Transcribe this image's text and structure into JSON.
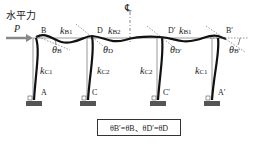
{
  "diagram": {
    "force_label": "水平力",
    "force_symbol": "P",
    "centerline_symbol": "℄",
    "nodes": {
      "top": [
        "B",
        "D",
        "D′",
        "B′"
      ],
      "bottom": [
        "A",
        "C",
        "C′",
        "A′"
      ]
    },
    "beam_stiffness": [
      {
        "k": "k",
        "sub": "B1"
      },
      {
        "k": "k",
        "sub": "B2"
      },
      {
        "k": "k",
        "sub": "B1"
      }
    ],
    "column_stiffness": [
      {
        "k": "k",
        "sub": "C1"
      },
      {
        "k": "k",
        "sub": "C2"
      },
      {
        "k": "k",
        "sub": "C2"
      },
      {
        "k": "k",
        "sub": "C1"
      }
    ],
    "rotations": [
      {
        "theta": "θ",
        "sub": "B"
      },
      {
        "theta": "θ",
        "sub": "D"
      },
      {
        "theta": "θ",
        "sub": "D′"
      },
      {
        "theta": "θ",
        "sub": "B′"
      }
    ],
    "formula": "θB′=θB、θD′=θD",
    "colors": {
      "deformed": "#111111",
      "original": "#888888",
      "arrow": "#777777"
    }
  }
}
